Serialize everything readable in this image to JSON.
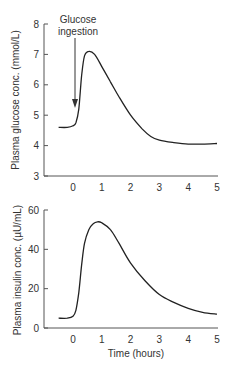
{
  "chart_data": [
    {
      "type": "line",
      "title": "",
      "xlabel": "",
      "ylabel": "Plasma glucose conc. (mmol/L)",
      "xlim": [
        -0.6,
        5
      ],
      "ylim": [
        3,
        8
      ],
      "xticks": [
        "0",
        "1",
        "2",
        "3",
        "4",
        "5"
      ],
      "yticks": [
        "3",
        "4",
        "5",
        "6",
        "7",
        "8"
      ],
      "grid": false,
      "annotation": {
        "text_line1": "Glucose",
        "text_line2": "ingestion",
        "x": 0.1,
        "arrow_to_y": 4.8
      },
      "series": [
        {
          "name": "Plasma glucose",
          "x": [
            -0.5,
            -0.2,
            0.0,
            0.1,
            0.2,
            0.3,
            0.4,
            0.55,
            0.75,
            1.0,
            1.3,
            1.6,
            2.0,
            2.4,
            2.7,
            3.0,
            3.5,
            4.0,
            4.5,
            5.0
          ],
          "y": [
            4.6,
            4.6,
            4.65,
            4.75,
            5.2,
            6.3,
            6.95,
            7.1,
            7.0,
            6.6,
            6.1,
            5.6,
            5.0,
            4.55,
            4.3,
            4.18,
            4.1,
            4.05,
            4.05,
            4.07
          ]
        }
      ]
    },
    {
      "type": "line",
      "title": "",
      "xlabel": "Time (hours)",
      "ylabel": "Plasma insulin conc. (µU/mL)",
      "xlim": [
        -0.6,
        5
      ],
      "ylim": [
        0,
        60
      ],
      "xticks": [
        "0",
        "1",
        "2",
        "3",
        "4",
        "5"
      ],
      "yticks": [
        "0",
        "20",
        "40",
        "60"
      ],
      "grid": false,
      "series": [
        {
          "name": "Plasma insulin",
          "x": [
            -0.5,
            -0.2,
            0.0,
            0.1,
            0.2,
            0.3,
            0.4,
            0.55,
            0.7,
            0.85,
            1.0,
            1.3,
            1.6,
            2.0,
            2.5,
            3.0,
            3.5,
            4.0,
            4.5,
            5.0
          ],
          "y": [
            5,
            5,
            6,
            9,
            18,
            32,
            43,
            50,
            53,
            54,
            53.5,
            50,
            43,
            33,
            24,
            17,
            13,
            10,
            8,
            7
          ]
        }
      ]
    }
  ],
  "labels": {
    "top_ylabel": "Plasma glucose conc. (mmol/L)",
    "bottom_ylabel": "Plasma insulin conc. (µU/mL)",
    "xlabel": "Time (hours)",
    "annotation_line1": "Glucose",
    "annotation_line2": "ingestion",
    "top_yticks": [
      "3",
      "4",
      "5",
      "6",
      "7",
      "8"
    ],
    "bottom_yticks": [
      "0",
      "20",
      "40",
      "60"
    ],
    "xticks": [
      "0",
      "1",
      "2",
      "3",
      "4",
      "5"
    ]
  }
}
